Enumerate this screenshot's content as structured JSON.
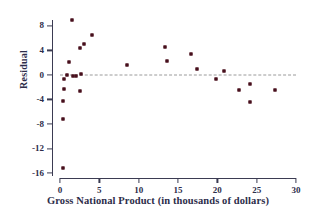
{
  "chart_data": {
    "type": "scatter",
    "title": "",
    "xlabel": "Gross National Product (in thousands of dollars)",
    "ylabel": "Residual",
    "xlim": [
      0,
      30
    ],
    "ylim": [
      -16.8,
      9.6
    ],
    "xticks": [
      0,
      5,
      10,
      15,
      20,
      25,
      30
    ],
    "xtick_labels": [
      "0",
      "5",
      "10",
      "15",
      "20",
      "25",
      "30"
    ],
    "yticks": [
      8,
      4,
      0,
      -4,
      -8,
      -12,
      -16
    ],
    "ytick_labels": [
      "8",
      "4",
      "0",
      "-4",
      "-8",
      "-12",
      "-16"
    ],
    "grid": false,
    "legend": null,
    "reference_line": {
      "name": "zero-residual-line",
      "y": 0,
      "style": "dashed",
      "color": "#9a9a9a"
    },
    "marker": {
      "shape": "square",
      "color": "#6b1a2a",
      "size": 3
    },
    "points": [
      {
        "x": 0.4,
        "y": -15.2
      },
      {
        "x": 0.4,
        "y": -7.2
      },
      {
        "x": 0.4,
        "y": -4.2
      },
      {
        "x": 0.5,
        "y": -2.3
      },
      {
        "x": 0.5,
        "y": -0.6
      },
      {
        "x": 0.9,
        "y": 0.0
      },
      {
        "x": 1.2,
        "y": 2.1
      },
      {
        "x": 1.5,
        "y": 9.0
      },
      {
        "x": 1.6,
        "y": -0.2
      },
      {
        "x": 2.0,
        "y": -0.1
      },
      {
        "x": 2.6,
        "y": 4.4
      },
      {
        "x": 2.6,
        "y": -2.6
      },
      {
        "x": 2.7,
        "y": 0.2
      },
      {
        "x": 3.0,
        "y": 5.0
      },
      {
        "x": 4.1,
        "y": 6.5
      },
      {
        "x": 8.5,
        "y": 1.6
      },
      {
        "x": 13.4,
        "y": 4.5
      },
      {
        "x": 13.6,
        "y": 2.3
      },
      {
        "x": 16.6,
        "y": 3.4
      },
      {
        "x": 17.4,
        "y": 0.9
      },
      {
        "x": 19.8,
        "y": -0.7
      },
      {
        "x": 20.8,
        "y": 0.7
      },
      {
        "x": 22.7,
        "y": -2.4
      },
      {
        "x": 24.2,
        "y": -1.5
      },
      {
        "x": 24.2,
        "y": -4.4
      },
      {
        "x": 27.3,
        "y": -2.5
      }
    ]
  },
  "colors": {
    "marker": "#6b1a2a",
    "axis": "#3b3b52",
    "text": "#2d2d4a",
    "reference_line": "#9a9a9a",
    "background": "#ffffff"
  }
}
